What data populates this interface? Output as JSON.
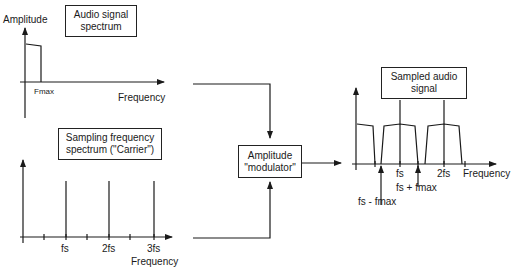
{
  "audio_panel": {
    "title_line1": "Audio signal",
    "title_line2": "spectrum",
    "y_label": "Amplitude",
    "x_label": "Frequency",
    "tick_label": "Fmax"
  },
  "carrier_panel": {
    "title_line1": "Sampling frequency",
    "title_line2": "spectrum (\"Carrier\")",
    "x_label": "Frequency",
    "ticks": [
      "fs",
      "2fs",
      "3fs"
    ]
  },
  "modulator": {
    "line1": "Amplitude",
    "line2": "\"modulator\""
  },
  "output_panel": {
    "title_line1": "Sampled audio",
    "title_line2": "signal",
    "x_label": "Frequency",
    "ticks": [
      "fs",
      "2fs"
    ],
    "annotation_upper": "fs + fmax",
    "annotation_lower": "fs - fmax"
  }
}
